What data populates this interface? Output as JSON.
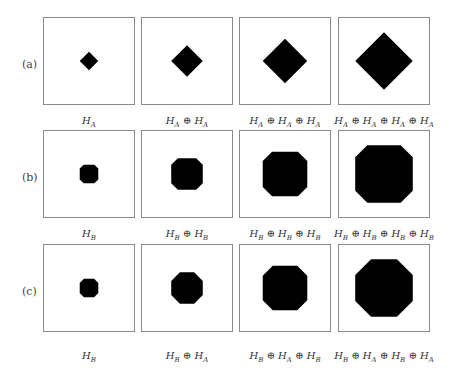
{
  "figure": {
    "rows": [
      {
        "label": "(a)",
        "captions": [
          "H_A",
          "H_A ⊕ H_A",
          "H_A ⊕ H_A ⊕ H_A",
          "H_A ⊕ H_A ⊕ H_A ⊕ H_A"
        ],
        "captions_display": [
          "HA",
          "HA⊕HA",
          "HA⊕HA⊕HA",
          "HA⊕HA⊕HA⊕HA"
        ],
        "shape": "diamond",
        "sizes": [
          10,
          17,
          24,
          31
        ]
      },
      {
        "label": "(b)",
        "captions_display": [
          "HB",
          "HB⊕HB",
          "HB⊕HB⊕HB",
          "HB⊕HB⊕HB⊕HB"
        ],
        "shape": "octagon",
        "sizes": [
          10,
          17,
          24,
          31
        ]
      },
      {
        "label": "(c)",
        "captions_display": [
          "HB",
          "HB⊕HA",
          "HB⊕HA⊕HB",
          "HB⊕HA⊕HB⊕HA"
        ],
        "shape": "mixed",
        "sizes": [
          10,
          17,
          24,
          31
        ]
      }
    ]
  }
}
